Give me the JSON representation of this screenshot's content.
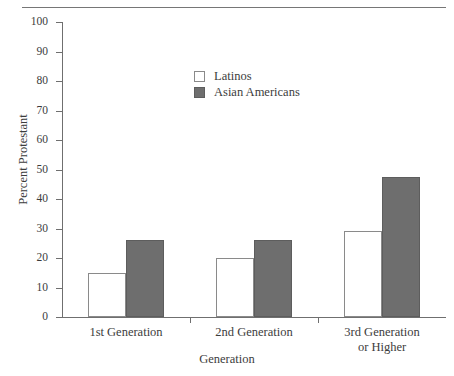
{
  "chart_data": {
    "type": "bar",
    "title": "",
    "xlabel": "Generation",
    "ylabel": "Percent Protestant",
    "ylim": [
      0,
      100
    ],
    "ytick_step": 10,
    "grid": false,
    "legend_position": "upper center",
    "categories": [
      "1st Generation",
      "2nd Generation",
      "3rd Generation or Higher"
    ],
    "category_lines": [
      [
        "1st Generation"
      ],
      [
        "2nd Generation"
      ],
      [
        "3rd Generation",
        "or Higher"
      ]
    ],
    "yticks": [
      "0",
      "10",
      "20",
      "30",
      "40",
      "50",
      "60",
      "70",
      "80",
      "90",
      "100"
    ],
    "series": [
      {
        "name": "Latinos",
        "color": "#ffffff",
        "values": [
          15,
          20,
          29
        ]
      },
      {
        "name": "Asian Americans",
        "color": "#6e6e6e",
        "values": [
          26,
          26,
          47.5
        ]
      }
    ]
  },
  "legend": {
    "items": [
      {
        "label": "Latinos",
        "swatch": "hollow-square-swatch"
      },
      {
        "label": "Asian Americans",
        "swatch": "filled-square-swatch"
      }
    ]
  },
  "axes": {
    "y_title": "Percent Protestant",
    "x_title": "Generation"
  }
}
